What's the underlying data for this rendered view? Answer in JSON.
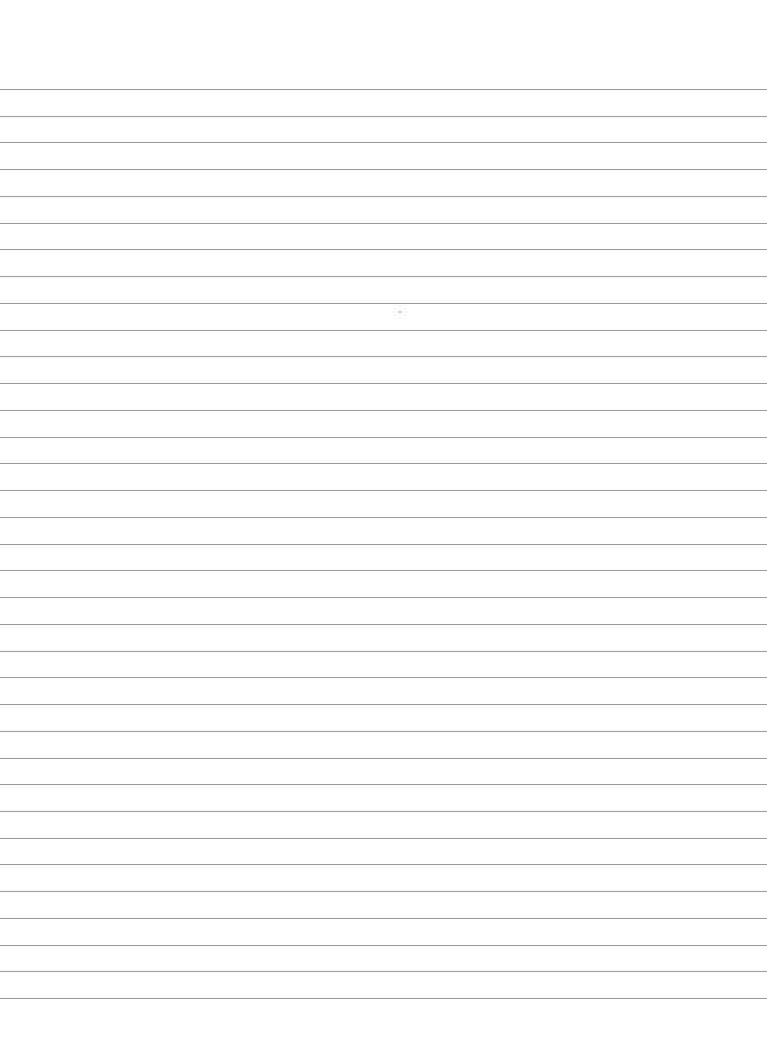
{
  "page": {
    "type": "lined-paper",
    "background": "#ffffff",
    "line_color": "#9a9a9a",
    "first_line_y": 89,
    "line_spacing": 26.74,
    "line_count": 35,
    "speck": {
      "x": 399,
      "y": 311
    }
  }
}
